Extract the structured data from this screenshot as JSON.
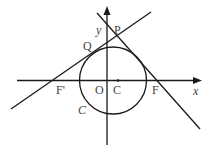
{
  "figure": {
    "axes": {
      "x_label": "x",
      "y_label": "y",
      "origin_label": "O"
    },
    "points": {
      "P": "P",
      "Q": "Q",
      "F_prime": "F'",
      "F": "F",
      "center": "C"
    },
    "curve_label": "C",
    "stroke_color": "#1a1a1a",
    "label_color": "#444444"
  }
}
